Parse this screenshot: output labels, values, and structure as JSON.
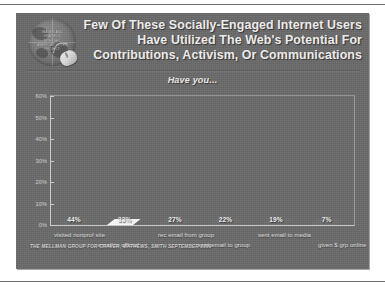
{
  "slide": {
    "title_lines": [
      "Few Of These Socially-Engaged Internet Users",
      "Have Utilized The Web's Potential For",
      "Contributions, Activism, Or Communications"
    ],
    "subtitle": "Have you...",
    "footer": "THE MELLMAN GROUP FOR CRAVER, MATHEWS, SMITH SEPTEMBER 1999",
    "logo": {
      "name": "globe-logo",
      "inner_text": "IMAGES AND GRAPHICS INTERNET AMERICAN VOTER PROJECT"
    },
    "colors": {
      "slide_background": "#6a6a6a",
      "title_text": "#f2f2f2",
      "bar_dark": "#3f3f3f",
      "bar_light": "#e6e6e6",
      "axis": "#cfcfcf",
      "page_background": "#ffffff"
    }
  },
  "chart_data": {
    "type": "bar",
    "title": "Have you...",
    "xlabel": "",
    "ylabel": "",
    "ylim": [
      0,
      60
    ],
    "grid": false,
    "legend": "none",
    "ytick_labels": [
      "60%",
      "50%",
      "40%",
      "30%",
      "20%",
      "10%",
      "0%"
    ],
    "ytick_values": [
      60,
      50,
      40,
      30,
      20,
      10,
      0
    ],
    "categories": [
      "visited nonprof site",
      "email to official",
      "rec email from group",
      "sent email to group",
      "sent email to media",
      "given $ grp online"
    ],
    "values": [
      44,
      33,
      27,
      22,
      19,
      7
    ],
    "value_labels": [
      "44%",
      "33%",
      "27%",
      "22%",
      "19%",
      "7%"
    ],
    "bar_styles": [
      "dark",
      "light",
      "dark",
      "dark",
      "dark",
      "dark"
    ]
  }
}
